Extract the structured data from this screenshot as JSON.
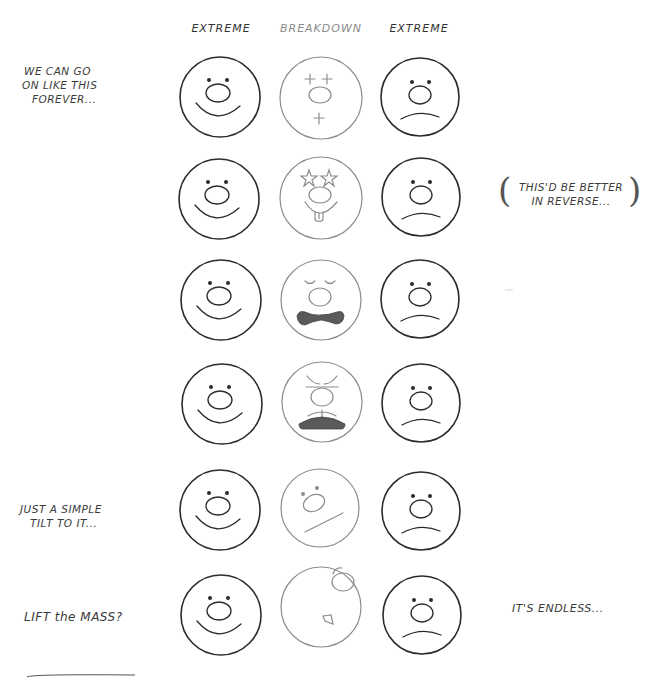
{
  "page": {
    "type": "sketch-sheet",
    "background": "#ffffff",
    "ink_dark": "#2b2b2b",
    "ink_light": "#8c8c8c"
  },
  "columns": [
    {
      "label": "EXTREME",
      "tone": "dark",
      "x": 220
    },
    {
      "label": "BREAKDOWN",
      "tone": "light",
      "x": 321
    },
    {
      "label": "EXTREME",
      "tone": "dark",
      "x": 420
    }
  ],
  "notes": {
    "row1_left": [
      "WE CAN GO",
      "ON LIKE THIS",
      "FOREVER..."
    ],
    "row2_right": [
      "THIS'D BE BETTER",
      "IN REVERSE..."
    ],
    "row5_left": [
      "JUST A SIMPLE",
      "TILT TO IT..."
    ],
    "row6_left": [
      "LIFT the MASS?"
    ],
    "row6_right": [
      "IT'S ENDLESS..."
    ]
  },
  "rows": [
    {
      "index": 1,
      "y": 97,
      "left": "happy",
      "breakdown": "crosses-eyes-and-mouth",
      "right": "sad"
    },
    {
      "index": 2,
      "y": 198,
      "left": "happy",
      "breakdown": "star-eyes-tongue-out",
      "right": "sad"
    },
    {
      "index": 3,
      "y": 300,
      "left": "happy",
      "breakdown": "closed-eyes-bowtie-mouth",
      "right": "sad"
    },
    {
      "index": 4,
      "y": 403,
      "left": "happy",
      "breakdown": "angry-brows-open-mouth",
      "right": "sad"
    },
    {
      "index": 5,
      "y": 510,
      "left": "happy",
      "breakdown": "tilted-face",
      "right": "sad"
    },
    {
      "index": 6,
      "y": 614,
      "left": "happy",
      "breakdown": "turned-away-face",
      "right": "sad"
    }
  ]
}
